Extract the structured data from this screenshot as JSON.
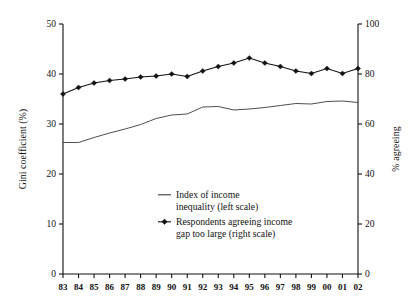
{
  "chart_data": {
    "type": "line",
    "title": "",
    "xlabel": "",
    "grid": false,
    "legend_position": "inside-center",
    "x": [
      "83",
      "84",
      "85",
      "86",
      "87",
      "88",
      "89",
      "90",
      "91",
      "92",
      "93",
      "94",
      "95",
      "96",
      "97",
      "98",
      "99",
      "00",
      "01",
      "02"
    ],
    "axes": {
      "left": {
        "label": "Gini coefficient (%)",
        "ylim": [
          0,
          50
        ],
        "ticks": [
          0,
          10,
          20,
          30,
          40,
          50
        ],
        "tick_labels": [
          "0",
          "10",
          "20",
          "30",
          "40",
          "50"
        ]
      },
      "right": {
        "label": "% agreeing",
        "ylim": [
          0,
          100
        ],
        "ticks": [
          0,
          20,
          40,
          60,
          80,
          100
        ],
        "tick_labels": [
          "0",
          "20",
          "40",
          "60",
          "80",
          "100"
        ]
      }
    },
    "series": [
      {
        "name": "Index of income inequality (left scale)",
        "axis": "left",
        "style": "line",
        "marker": "none",
        "color": "#3a3a3a",
        "values": [
          26.3,
          26.3,
          27.3,
          28.2,
          29.0,
          29.9,
          31.1,
          31.8,
          32.0,
          33.4,
          33.5,
          32.8,
          33.0,
          33.3,
          33.7,
          34.1,
          34.0,
          34.5,
          34.6,
          34.3
        ]
      },
      {
        "name": "Respondents agreeing income gap too large (right scale)",
        "axis": "right",
        "style": "line-marker",
        "marker": "diamond",
        "color": "#111111",
        "values": [
          72.0,
          74.6,
          76.4,
          77.4,
          78.0,
          78.8,
          79.2,
          80.0,
          79.0,
          81.2,
          83.0,
          84.4,
          86.4,
          84.4,
          83.0,
          81.2,
          80.2,
          82.2,
          80.2,
          82.2
        ]
      }
    ],
    "legend": [
      {
        "marker": "plain-line",
        "line1": "Index of income",
        "line2": "inequality (left scale)"
      },
      {
        "marker": "diamond-line",
        "line1": "Respondents agreeing income",
        "line2": "gap too large (right scale)"
      }
    ]
  }
}
